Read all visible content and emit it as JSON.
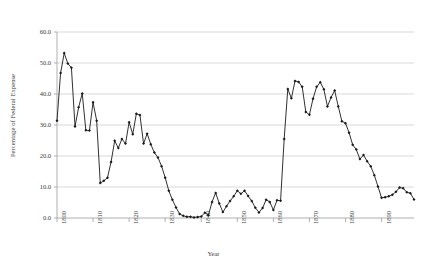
{
  "chart_data": {
    "type": "line",
    "title": "",
    "xlabel": "Year",
    "ylabel": "Percentage of Federal Expense",
    "xlim": [
      1800,
      1899
    ],
    "ylim": [
      0.0,
      60.0
    ],
    "grid": true,
    "legend": false,
    "marker": "diamond",
    "line_color": "#1a1a1a",
    "grid_color": "#c8c8c8",
    "axis_color": "#a6a6a6",
    "ytick_labels": [
      "0.0",
      "10.0",
      "20.0",
      "30.0",
      "40.0",
      "50.0",
      "60.0"
    ],
    "ytick_values": [
      0.0,
      10.0,
      20.0,
      30.0,
      40.0,
      50.0,
      60.0
    ],
    "xtick_labels": [
      "1800",
      "1810",
      "1820",
      "1830",
      "1840",
      "1850",
      "1860",
      "1870",
      "1880",
      "1890"
    ],
    "xtick_values": [
      1800,
      1810,
      1820,
      1830,
      1840,
      1850,
      1860,
      1870,
      1880,
      1890
    ],
    "series": [
      {
        "name": "Percentage of Federal Expense",
        "x": [
          1800,
          1801,
          1802,
          1803,
          1804,
          1805,
          1806,
          1807,
          1808,
          1809,
          1810,
          1811,
          1812,
          1813,
          1814,
          1815,
          1816,
          1817,
          1818,
          1819,
          1820,
          1821,
          1822,
          1823,
          1824,
          1825,
          1826,
          1827,
          1828,
          1829,
          1830,
          1831,
          1832,
          1833,
          1834,
          1835,
          1836,
          1837,
          1838,
          1839,
          1840,
          1841,
          1842,
          1843,
          1844,
          1845,
          1846,
          1847,
          1848,
          1849,
          1850,
          1851,
          1852,
          1853,
          1854,
          1855,
          1856,
          1857,
          1858,
          1859,
          1860,
          1861,
          1862,
          1863,
          1864,
          1865,
          1866,
          1867,
          1868,
          1869,
          1870,
          1871,
          1872,
          1873,
          1874,
          1875,
          1876,
          1877,
          1878,
          1879,
          1880,
          1881,
          1882,
          1883,
          1884,
          1885,
          1886,
          1887,
          1888,
          1889,
          1890,
          1891,
          1892,
          1893,
          1894,
          1895,
          1896,
          1897,
          1898,
          1899
        ],
        "values": [
          31.4,
          46.8,
          53.2,
          49.8,
          48.5,
          29.5,
          35.7,
          40.2,
          28.3,
          28.2,
          37.3,
          31.4,
          11.3,
          12.0,
          13.0,
          18.1,
          24.9,
          22.6,
          25.5,
          24.0,
          30.9,
          27.0,
          33.6,
          33.2,
          24.0,
          27.2,
          23.8,
          21.1,
          19.5,
          16.7,
          13.0,
          8.8,
          5.9,
          3.4,
          1.3,
          0.7,
          0.4,
          0.4,
          0.2,
          0.3,
          0.5,
          1.7,
          0.9,
          5.2,
          8.1,
          4.7,
          1.9,
          3.8,
          5.5,
          7.0,
          8.8,
          7.8,
          8.8,
          7.1,
          5.5,
          3.3,
          1.8,
          3.2,
          5.9,
          5.2,
          2.6,
          5.7,
          5.6,
          25.5,
          41.6,
          38.6,
          44.2,
          43.9,
          42.3,
          34.2,
          33.3,
          38.5,
          42.3,
          43.8,
          41.5,
          36.0,
          38.9,
          41.1,
          36.0,
          31.2,
          30.6,
          27.5,
          23.6,
          22.1,
          19.0,
          20.3,
          18.3,
          16.7,
          13.8,
          10.2,
          6.5,
          6.7,
          7.0,
          7.5,
          8.5,
          9.8,
          9.6,
          8.3,
          8.0,
          6.0
        ]
      }
    ]
  },
  "chart": {
    "ylabel": "Percentage of Federal Expense",
    "xlabel": "Year"
  }
}
